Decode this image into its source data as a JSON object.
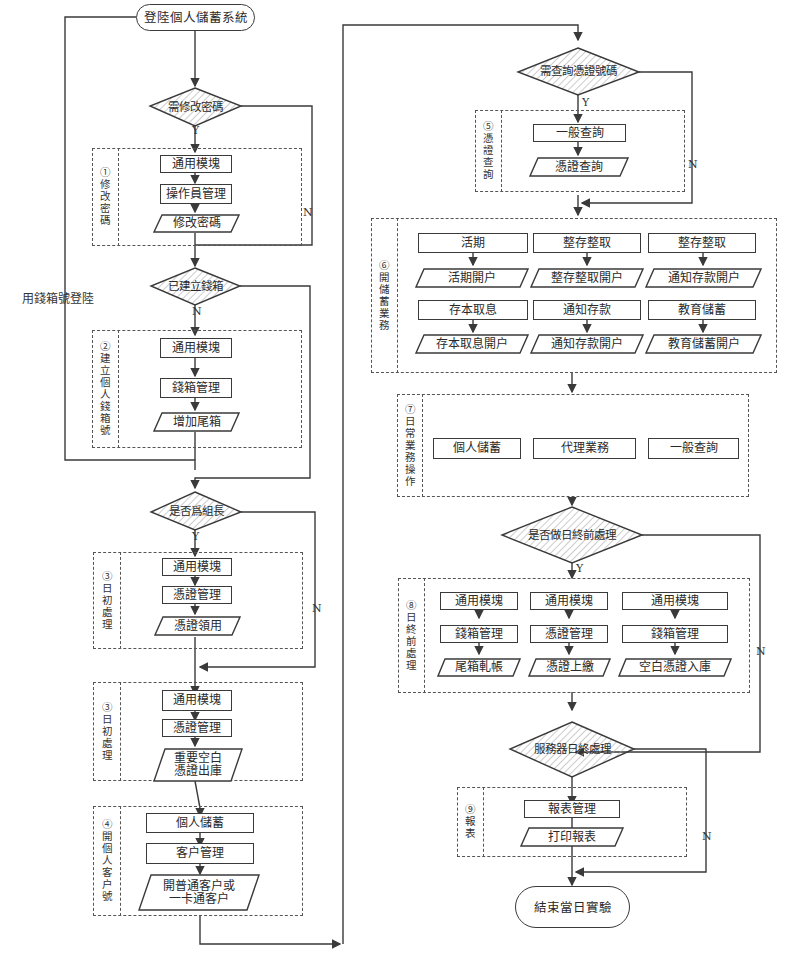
{
  "diagram": {
    "left_column": {
      "start": "登陸個人儲蓄系統",
      "login_with_cashbox": "用錢箱號登陸",
      "decision_change_password": {
        "label": "需修改密碼",
        "yes": "Y",
        "no": "N"
      },
      "group1": {
        "label": "①修改密碼",
        "steps": [
          "通用模塊",
          "操作員管理"
        ],
        "output": "修改密碼"
      },
      "decision_cashbox_created": {
        "label": "已建立錢箱",
        "yes": "",
        "no": "N"
      },
      "group2": {
        "label": "②建立個人錢箱號",
        "steps": [
          "通用模塊",
          "錢箱管理"
        ],
        "output": "增加尾箱"
      },
      "decision_team_leader": {
        "label": "是否爲組長",
        "yes": "Y",
        "no": "N"
      },
      "group3a": {
        "label": "③日初處理",
        "steps": [
          "通用模塊",
          "憑證管理"
        ],
        "output": "憑證領用"
      },
      "group3b": {
        "label": "③日初處理",
        "steps": [
          "通用模塊",
          "憑證管理"
        ],
        "output": "重要空白\n憑證出庫"
      },
      "group4": {
        "label": "④開個人客户號",
        "steps": [
          "個人儲蓄",
          "客户管理"
        ],
        "output": "開普通客户或\n一卡通客户"
      }
    },
    "right_column": {
      "decision_query_voucher": {
        "label": "需查詢憑證號碼",
        "yes": "Y",
        "no": "N"
      },
      "group5": {
        "label": "⑤憑證查詢",
        "steps": [
          "一般查詢"
        ],
        "output": "憑證查詢"
      },
      "group6": {
        "label": "⑥開儲蓄業務",
        "row1": [
          {
            "step": "活期",
            "output": "活期開户"
          },
          {
            "step": "整存整取",
            "output": "整存整取開户"
          },
          {
            "step": "整存整取",
            "output": "通知存款開户"
          }
        ],
        "row2": [
          {
            "step": "存本取息",
            "output": "存本取息開户"
          },
          {
            "step": "通知存款",
            "output": "通知存款開户"
          },
          {
            "step": "教育儲蓄",
            "output": "教育儲蓄開户"
          }
        ]
      },
      "group7": {
        "label": "⑦日常業務操作",
        "items": [
          "個人儲蓄",
          "代理業務",
          "一般查詢"
        ]
      },
      "decision_end_of_day_pre": {
        "label": "是否做日終前處理",
        "yes": "Y",
        "no": "N"
      },
      "group8": {
        "label": "⑧日終前處理",
        "columns": [
          {
            "steps": [
              "通用模塊",
              "錢箱管理"
            ],
            "output": "尾箱軋帳"
          },
          {
            "steps": [
              "通用模塊",
              "憑證管理"
            ],
            "output": "憑證上繳"
          },
          {
            "steps": [
              "通用模塊",
              "錢箱管理"
            ],
            "output": "空白憑證入庫"
          }
        ]
      },
      "decision_server_eod": {
        "label": "服務器日終處理",
        "yes": "",
        "no": "N"
      },
      "group9": {
        "label": "⑨報表",
        "steps": [
          "報表管理"
        ],
        "output": "打印報表"
      },
      "end": "結束當日實驗"
    }
  },
  "colors": {
    "line": "#3a3a3a",
    "hatch": "#9a9a9a",
    "background": "#ffffff"
  }
}
